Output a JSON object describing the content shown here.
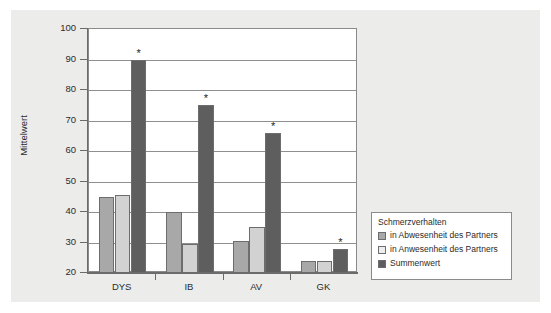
{
  "chart_data": {
    "type": "bar",
    "title": "",
    "subtitle": "",
    "xlabel": "",
    "ylabel": "Mittelwert",
    "ylim": [
      20,
      100
    ],
    "ytick_step": 10,
    "yticks": [
      20,
      30,
      40,
      50,
      60,
      70,
      80,
      90,
      100
    ],
    "ytick_labels": [
      "20",
      "30",
      "40",
      "50",
      "60",
      "70",
      "80",
      "90",
      "100"
    ],
    "categories": [
      "DYS",
      "IB",
      "AV",
      "GK"
    ],
    "grid": "horizontal",
    "legend_position": "right-outside",
    "legend_title": "Schmerzverhalten",
    "series": [
      {
        "name": "in Abwesenheit des Partners",
        "color": "#a8a8a8",
        "values": [
          45.0,
          40.0,
          30.5,
          24.0
        ]
      },
      {
        "name": "in Anwesenheit des Partners",
        "color": "#d2d2d2",
        "values": [
          45.5,
          29.5,
          35.0,
          24.0
        ]
      },
      {
        "name": "Summenwert",
        "color": "#5e5e5e",
        "values": [
          90.0,
          75.0,
          66.0,
          28.0
        ]
      }
    ],
    "annotations": [
      {
        "text": "*",
        "category": "DYS",
        "series": "Summenwert",
        "value": 90.0
      },
      {
        "text": "*",
        "category": "IB",
        "series": "Summenwert",
        "value": 75.0
      },
      {
        "text": "*",
        "category": "AV",
        "series": "Summenwert",
        "value": 66.0
      },
      {
        "text": "*",
        "category": "GK",
        "series": "Summenwert",
        "value": 28.0
      }
    ]
  },
  "axes": {
    "y_title": "Mittelwert",
    "y_labels": [
      "100",
      "90",
      "80",
      "70",
      "60",
      "50",
      "40",
      "30",
      "20"
    ],
    "x_labels": [
      "DYS",
      "IB",
      "AV",
      "GK"
    ]
  },
  "legend": {
    "title": "Schmerzverhalten",
    "items": [
      {
        "label": "in Abwesenheit des Partners",
        "color": "#a8a8a8"
      },
      {
        "label": "in Anwesenheit des Partners",
        "color": "#ededed"
      },
      {
        "label": "Summenwert",
        "color": "#5e5e5e"
      }
    ]
  },
  "colors": {
    "series_1": "#a8a8a8",
    "series_2": "#d2d2d2",
    "series_3": "#5e5e5e",
    "panel_background": "#ececeb",
    "plot_background": "#ffffff",
    "axis": "#6b6b6b",
    "grid": "#8f8f8f"
  }
}
